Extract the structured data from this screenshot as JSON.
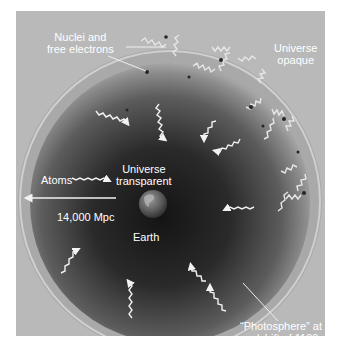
{
  "figure": {
    "type": "diagram"
  },
  "labels": {
    "nuclei": [
      "Nuclei and",
      "free electrons"
    ],
    "opaque": [
      "Universe",
      "opaque"
    ],
    "atoms": "Atoms",
    "transparent": [
      "Universe",
      "transparent"
    ],
    "distance": "14,000 Mpc",
    "earth": "Earth",
    "photosphere": [
      "“Photosphere” at",
      "redshift of 1100"
    ]
  },
  "colors": {
    "panel_bg": "#b9b9b9",
    "sphere_dark": "#1e1e1e",
    "sphere_mid": "#6a6a6a",
    "rim": "#c4c4c4",
    "text": "#ffffff",
    "photon": "#f2f2f2",
    "particle": "#2a2a2a"
  }
}
